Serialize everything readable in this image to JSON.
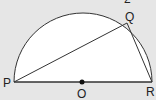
{
  "diagram": {
    "points": {
      "P": {
        "label": "P",
        "x": 14,
        "y": 82
      },
      "Q": {
        "label": "Q",
        "x": 127,
        "y": 23
      },
      "R": {
        "label": "R",
        "x": 152,
        "y": 82
      },
      "O": {
        "label": "O",
        "x": 82,
        "y": 82
      }
    },
    "partial_label": "2",
    "colors": {
      "background": "#e6e6e6",
      "fill": "#ffffff",
      "stroke": "#333333"
    }
  }
}
